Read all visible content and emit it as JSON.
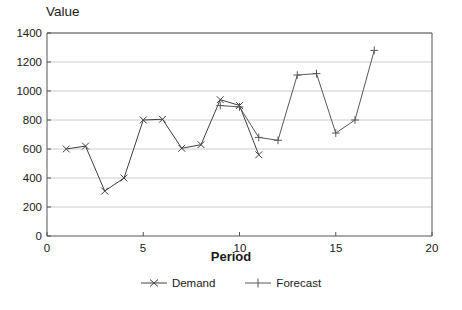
{
  "chart_data": {
    "type": "line",
    "title": "",
    "xlabel": "Period",
    "ylabel": "Value",
    "xlim": [
      0,
      20
    ],
    "ylim": [
      0,
      1400
    ],
    "xticks": [
      0,
      5,
      10,
      15,
      20
    ],
    "yticks": [
      0,
      200,
      400,
      600,
      800,
      1000,
      1200,
      1400
    ],
    "grid": "horizontal",
    "legend_position": "bottom-center",
    "series": [
      {
        "name": "Demand",
        "marker": "x",
        "color": "#404040",
        "x": [
          1,
          2,
          3,
          4,
          5,
          6,
          7,
          8,
          9,
          10,
          11
        ],
        "values": [
          600,
          620,
          310,
          400,
          800,
          805,
          605,
          630,
          940,
          900,
          560
        ]
      },
      {
        "name": "Forecast",
        "marker": "plus",
        "color": "#595959",
        "x": [
          9,
          10,
          11,
          12,
          13,
          14,
          15,
          16,
          17
        ],
        "values": [
          900,
          890,
          680,
          660,
          1110,
          1120,
          710,
          800,
          1280
        ]
      }
    ]
  },
  "axes": {
    "y_title": "Value",
    "x_title": "Period",
    "y_tick_labels": [
      "1400",
      "1200",
      "1000",
      "800",
      "600",
      "400",
      "200",
      "0"
    ],
    "x_tick_labels": [
      "0",
      "5",
      "10",
      "15",
      "20"
    ]
  },
  "legend": {
    "items": [
      {
        "label": "Demand",
        "marker": "x-marker-icon"
      },
      {
        "label": "Forecast",
        "marker": "plus-marker-icon"
      }
    ]
  },
  "style": {
    "plot_border": "#555555",
    "gridline": "#cccccc",
    "text": "#1a1a1a",
    "background": "#ffffff"
  }
}
